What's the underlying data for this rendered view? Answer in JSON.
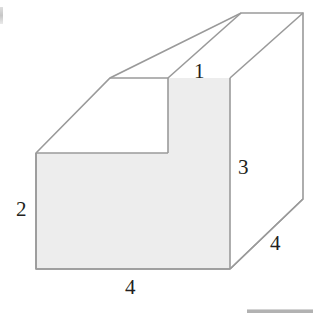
{
  "figure": {
    "kind": "3d-step-solid",
    "canvas": {
      "width": 316,
      "height": 320
    },
    "colors": {
      "background": "#ffffff",
      "face_fill_front": "#ededed",
      "face_fill_side": "#ededed",
      "face_fill_top": "#ffffff",
      "face_fill_right": "#ffffff",
      "stroke": "#9a9a9a",
      "label_text": "#231f20"
    },
    "stroke_width": 1.6
  },
  "labels": {
    "top_small": "1",
    "right_height": "3",
    "left_height": "2",
    "front_width": "4",
    "depth": "4"
  },
  "geometry": {
    "front_lower_face": "36,153 168,153 168,78 230,78 230,269 36,269",
    "top_upper_face": "110,78 300,13 303,19 230,78 168,78",
    "top_step_face": "36,153 110,78 168,78 168,153",
    "right_face": "230,78 303,19 303,199 230,269",
    "points": {
      "left_bottom": [
        36,
        269
      ],
      "left_top": [
        36,
        153
      ],
      "step_inner_top": [
        168,
        78
      ],
      "step_inner_bottom": [
        168,
        153
      ],
      "top_left_far": [
        110,
        78
      ],
      "front_right_top": [
        230,
        78
      ],
      "front_right_bottom": [
        230,
        269
      ],
      "far_top_left": [
        241,
        13
      ],
      "far_top_right": [
        303,
        13
      ],
      "far_right_bend": [
        303,
        199
      ]
    }
  }
}
